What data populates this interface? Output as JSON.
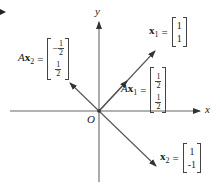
{
  "diagram": {
    "axes": {
      "x_label": "x",
      "y_label": "y",
      "origin_label": "O"
    },
    "vectors": [
      {
        "name": "x1",
        "label_prefix": "",
        "label_var": "x",
        "label_sub": "1",
        "equals": "=",
        "entries": [
          "1",
          "1"
        ]
      },
      {
        "name": "Ax1",
        "label_prefix": "A",
        "label_var": "x",
        "label_sub": "1",
        "equals": "=",
        "entries": [
          "1/2",
          "1/2"
        ]
      },
      {
        "name": "Ax2",
        "label_prefix": "A",
        "label_var": "x",
        "label_sub": "2",
        "equals": "=",
        "entries": [
          "-1/2",
          "1/2"
        ]
      },
      {
        "name": "x2",
        "label_prefix": "",
        "label_var": "x",
        "label_sub": "2",
        "equals": "=",
        "entries": [
          "1",
          "-1"
        ]
      }
    ],
    "fractions": {
      "num": "1",
      "den": "2",
      "minus": "−"
    },
    "colors": {
      "axis": "#555555",
      "vector": "#555555",
      "text": "#222222"
    }
  }
}
